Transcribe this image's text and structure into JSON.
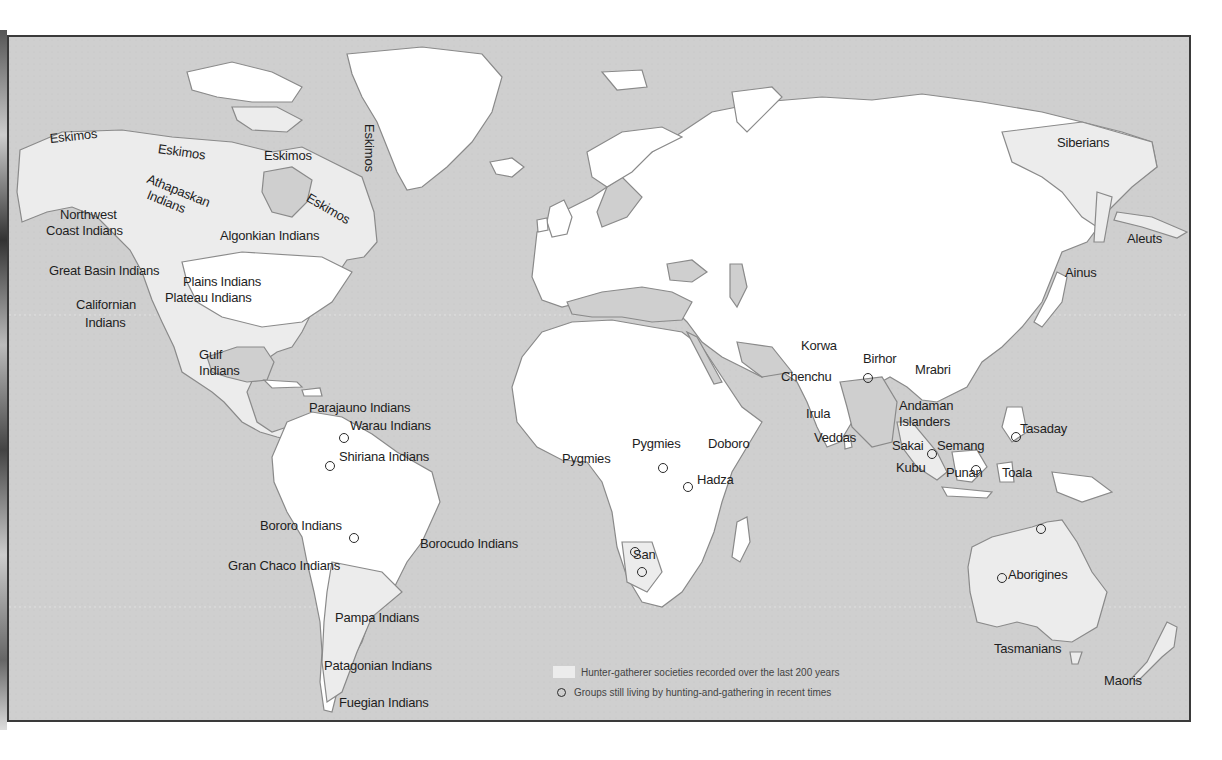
{
  "map": {
    "colors": {
      "ocean": "#cfcfcf",
      "land_other": "#d4d4d4",
      "hunter_gatherer_region": "#ececec",
      "land_white": "#ffffff",
      "coastline": "#8a8a8a",
      "text": "#1e1e1e"
    },
    "legend": {
      "region_label": "Hunter-gatherer societies recorded over the last 200 years",
      "marker_label": "Groups still living by hunting-and-gathering in recent times"
    },
    "labels": [
      {
        "text": "Eskimos",
        "x": 47,
        "y": 138,
        "rot": -6
      },
      {
        "text": "Eskimos",
        "x": 157,
        "y": 148,
        "rot": 8
      },
      {
        "text": "Eskimos",
        "x": 262,
        "y": 155,
        "rot": 0
      },
      {
        "text": "Eskimos",
        "x": 374,
        "y": 130,
        "rot": 90
      },
      {
        "text": "Eskimos",
        "x": 309,
        "y": 197,
        "rot": 30
      },
      {
        "text": "Athapaskan",
        "x": 148,
        "y": 178,
        "rot": 22
      },
      {
        "text": "Indians",
        "x": 148,
        "y": 194,
        "rot": 22
      },
      {
        "text": "Northwest",
        "x": 58,
        "y": 214,
        "rot": 0
      },
      {
        "text": "Coast Indians",
        "x": 44,
        "y": 230,
        "rot": 0
      },
      {
        "text": "Algonkian Indians",
        "x": 218,
        "y": 235,
        "rot": 0
      },
      {
        "text": "Great Basin Indians",
        "x": 47,
        "y": 270,
        "rot": 0
      },
      {
        "text": "Plains Indians",
        "x": 181,
        "y": 281,
        "rot": 0
      },
      {
        "text": "Plateau Indians",
        "x": 163,
        "y": 297,
        "rot": 0
      },
      {
        "text": "Californian",
        "x": 74,
        "y": 304,
        "rot": 0
      },
      {
        "text": "Indians",
        "x": 83,
        "y": 322,
        "rot": 0
      },
      {
        "text": "Gulf",
        "x": 197,
        "y": 354,
        "rot": 0
      },
      {
        "text": "Indians",
        "x": 197,
        "y": 370,
        "rot": 0
      },
      {
        "text": "Parajauno Indians",
        "x": 307,
        "y": 407,
        "rot": 0
      },
      {
        "text": "Warau Indians",
        "x": 348,
        "y": 425,
        "rot": 0
      },
      {
        "text": "Shiriana Indians",
        "x": 337,
        "y": 456,
        "rot": 0
      },
      {
        "text": "Bororo Indians",
        "x": 258,
        "y": 525,
        "rot": 0
      },
      {
        "text": "Borocudo Indians",
        "x": 418,
        "y": 543,
        "rot": 0
      },
      {
        "text": "Gran Chaco Indians",
        "x": 226,
        "y": 565,
        "rot": 0
      },
      {
        "text": "Pampa Indians",
        "x": 333,
        "y": 617,
        "rot": 0
      },
      {
        "text": "Patagonian Indians",
        "x": 322,
        "y": 665,
        "rot": 0
      },
      {
        "text": "Fuegian Indians",
        "x": 337,
        "y": 702,
        "rot": 0
      },
      {
        "text": "Korwa",
        "x": 799,
        "y": 345,
        "rot": 0
      },
      {
        "text": "Birhor",
        "x": 861,
        "y": 358,
        "rot": 0
      },
      {
        "text": "Chenchu",
        "x": 779,
        "y": 376,
        "rot": 0
      },
      {
        "text": "Mrabri",
        "x": 913,
        "y": 369,
        "rot": 0
      },
      {
        "text": "Andaman",
        "x": 897,
        "y": 405,
        "rot": 0
      },
      {
        "text": "Islanders",
        "x": 897,
        "y": 421,
        "rot": 0
      },
      {
        "text": "Irula",
        "x": 804,
        "y": 413,
        "rot": 0
      },
      {
        "text": "Veddas",
        "x": 812,
        "y": 437,
        "rot": 0
      },
      {
        "text": "Sakai",
        "x": 890,
        "y": 445,
        "rot": 0
      },
      {
        "text": "Semang",
        "x": 935,
        "y": 445,
        "rot": 0
      },
      {
        "text": "Tasaday",
        "x": 1018,
        "y": 428,
        "rot": 0
      },
      {
        "text": "Kubu",
        "x": 894,
        "y": 467,
        "rot": 0
      },
      {
        "text": "Punan",
        "x": 944,
        "y": 472,
        "rot": 0
      },
      {
        "text": "Toala",
        "x": 1000,
        "y": 472,
        "rot": 0
      },
      {
        "text": "Pygmies",
        "x": 560,
        "y": 458,
        "rot": 0
      },
      {
        "text": "Pygmies",
        "x": 630,
        "y": 443,
        "rot": 0
      },
      {
        "text": "Doboro",
        "x": 706,
        "y": 443,
        "rot": 0
      },
      {
        "text": "Hadza",
        "x": 695,
        "y": 479,
        "rot": 0
      },
      {
        "text": "San",
        "x": 631,
        "y": 554,
        "rot": 0
      },
      {
        "text": "Aborigines",
        "x": 1006,
        "y": 574,
        "rot": 0
      },
      {
        "text": "Tasmanians",
        "x": 992,
        "y": 648,
        "rot": 0
      },
      {
        "text": "Maoris",
        "x": 1102,
        "y": 680,
        "rot": 0
      },
      {
        "text": "Siberians",
        "x": 1055,
        "y": 142,
        "rot": 0
      },
      {
        "text": "Aleuts",
        "x": 1125,
        "y": 238,
        "rot": 0
      },
      {
        "text": "Ainus",
        "x": 1063,
        "y": 272,
        "rot": 0
      }
    ],
    "markers": [
      {
        "name": "warau",
        "x": 342,
        "y": 436
      },
      {
        "name": "shiriana",
        "x": 328,
        "y": 464
      },
      {
        "name": "bororo",
        "x": 352,
        "y": 536
      },
      {
        "name": "birhor",
        "x": 866,
        "y": 376
      },
      {
        "name": "semang",
        "x": 930,
        "y": 452
      },
      {
        "name": "tasaday",
        "x": 1014,
        "y": 435
      },
      {
        "name": "punan",
        "x": 974,
        "y": 468
      },
      {
        "name": "pygmies",
        "x": 661,
        "y": 466
      },
      {
        "name": "hadza",
        "x": 686,
        "y": 485
      },
      {
        "name": "san-1",
        "x": 633,
        "y": 550
      },
      {
        "name": "san-2",
        "x": 640,
        "y": 570
      },
      {
        "name": "aborigines",
        "x": 1000,
        "y": 576
      },
      {
        "name": "arnhem",
        "x": 1039,
        "y": 527
      }
    ]
  }
}
